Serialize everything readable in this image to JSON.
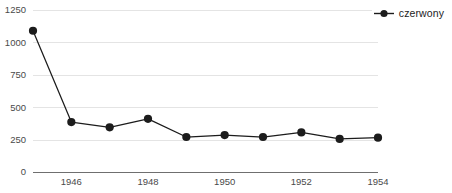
{
  "chart_data": {
    "type": "line",
    "title": "",
    "subtitle": "",
    "xlabel": "",
    "ylabel": "",
    "x": [
      1945,
      1946,
      1947,
      1948,
      1949,
      1950,
      1951,
      1952,
      1953,
      1954
    ],
    "series": [
      {
        "name": "czerwony",
        "color": "#1c1c1c",
        "values": [
          1090,
          385,
          345,
          410,
          270,
          285,
          270,
          305,
          255,
          265
        ]
      }
    ],
    "xlim": [
      1945,
      1954
    ],
    "ylim": [
      0,
      1250
    ],
    "ytick_values": [
      0,
      250,
      500,
      750,
      1000,
      1250
    ],
    "ytick_labels": [
      "0",
      "250",
      "500",
      "750",
      "1000",
      "1250"
    ],
    "xtick_values": [
      1946,
      1948,
      1950,
      1952,
      1954
    ],
    "xtick_labels": [
      "1946",
      "1948",
      "1950",
      "1952",
      "1954"
    ],
    "grid": "horizontal",
    "legend_position": "top-right",
    "legend_entries": [
      "czerwony"
    ],
    "annotations": []
  },
  "legend": {
    "entry_label": "czerwony",
    "marker_icon": "legend-dot-marker"
  },
  "caption": {
    "text": ""
  },
  "colors": {
    "series": "#1c1c1c",
    "gridline": "#e4e4e4",
    "axis": "#6f6f6f",
    "tick_text": "#4a4a4a",
    "background": "#ffffff"
  }
}
